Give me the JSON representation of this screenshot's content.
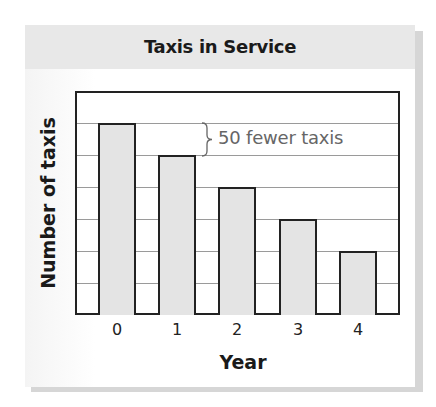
{
  "chart_data": {
    "type": "bar",
    "title": "Taxis in Service",
    "xlabel": "Year",
    "ylabel": "Number of taxis",
    "categories": [
      "0",
      "1",
      "2",
      "3",
      "4"
    ],
    "values": [
      300,
      250,
      200,
      150,
      100
    ],
    "unit_per_gridline": 50,
    "ylim": [
      0,
      350
    ],
    "grid": true,
    "y_tick_labels_shown": false,
    "annotation": {
      "text": "50 fewer taxis",
      "between_categories": [
        "0",
        "1"
      ],
      "type": "brace"
    },
    "colors": {
      "bar_fill": "#e4e4e4",
      "bar_border": "#222222",
      "gridline": "#9a9a9a",
      "header_band": "#e8e8e8",
      "annotation_text": "#666666"
    }
  }
}
